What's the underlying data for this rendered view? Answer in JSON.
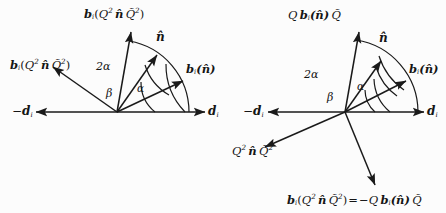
{
  "figure": {
    "kind": "vector-diagram-pair",
    "background": "#fcfcfc",
    "stroke_color": "#1a1a1a",
    "left": {
      "axis_labels": {
        "left": "−d",
        "left_sub": "i",
        "right": "d",
        "right_sub": "i"
      },
      "angles": {
        "big": "2α",
        "beta": "β",
        "alpha": "α"
      },
      "vectors": [
        {
          "name": "b-i-n-hat",
          "label": "b",
          "sub": "i",
          "arg": "(n̂)",
          "angle_deg": 25
        },
        {
          "name": "n-hat",
          "label": "n̂",
          "angle_deg": 55
        },
        {
          "name": "b-i-Q2-n-Q2-up",
          "label": "b",
          "sub": "i",
          "arg": "(Q² n̂ Q̃²)",
          "angle_deg": 80
        },
        {
          "name": "b-i-Q2-n-Q2-left",
          "label": "b",
          "sub": "i",
          "arg": "(Q² n̂ Q̃²)",
          "angle_deg": 145
        }
      ]
    },
    "right": {
      "axis_labels": {
        "left": "−d",
        "left_sub": "i",
        "right": "d",
        "right_sub": "i"
      },
      "angles": {
        "big": "2α",
        "beta": "β",
        "alpha": "α"
      },
      "vectors": [
        {
          "name": "b-i-n-hat",
          "angle_deg": 27
        },
        {
          "name": "n-hat",
          "angle_deg": 55
        },
        {
          "name": "Q-b-i-n-Qtilde",
          "angle_deg": 80
        },
        {
          "name": "Q2-n-Q2tilde",
          "angle_deg": 205
        },
        {
          "name": "b-i-Q2-n-Q2-eq",
          "angle_deg": -65
        }
      ]
    }
  },
  "labels": {
    "left_top": {
      "head": "b",
      "sub": "i",
      "open": "(",
      "Q": "Q",
      "Qexp": "2",
      "n": "n̂",
      "Qt": "Q̃",
      "Qtexp": "2",
      "close": ")"
    },
    "left_upperleft": {
      "head": "b",
      "sub": "i",
      "open": "(",
      "Q": "Q",
      "Qexp": "2",
      "n": "n̂",
      "Qt": "Q̃",
      "Qtexp": "2",
      "close": ")"
    },
    "left_right": {
      "head": "b",
      "sub": "i",
      "arg": "(n̂)"
    },
    "left_nhat": {
      "text": "n̂"
    },
    "left_dminus": {
      "minus": "−",
      "d": "d",
      "sub": "i"
    },
    "left_dplus": {
      "d": "d",
      "sub": "i"
    },
    "left_2alpha": {
      "text": "2α"
    },
    "left_beta": {
      "text": "β"
    },
    "left_alpha": {
      "text": "α"
    },
    "right_top": {
      "Q": "Q",
      "head": "b",
      "sub": "i",
      "arg": "(n̂)",
      "Qt": "Q̃"
    },
    "right_right": {
      "head": "b",
      "sub": "i",
      "arg": "(n̂)"
    },
    "right_nhat": {
      "text": "n̂"
    },
    "right_lowerleft": {
      "Q": "Q",
      "Qexp": "2",
      "n": "n̂",
      "Qt": "Q̃",
      "Qtexp": "2"
    },
    "right_dminus": {
      "minus": "−",
      "d": "d",
      "sub": "i"
    },
    "right_dplus": {
      "d": "d",
      "sub": "i"
    },
    "right_2alpha": {
      "text": "2α"
    },
    "right_beta": {
      "text": "β"
    },
    "right_alpha": {
      "text": "α"
    },
    "right_equation": {
      "head": "b",
      "sub": "i",
      "open": "(",
      "Q": "Q",
      "Qexp": "2",
      "n": "n̂",
      "Qt": "Q̃",
      "Qtexp": "2",
      "close": ")",
      "eq": "=",
      "minus": "−",
      "Q2": "Q",
      "head2": "b",
      "sub2": "i",
      "arg2": "(n̂)",
      "Qt2": "Q̃"
    }
  }
}
